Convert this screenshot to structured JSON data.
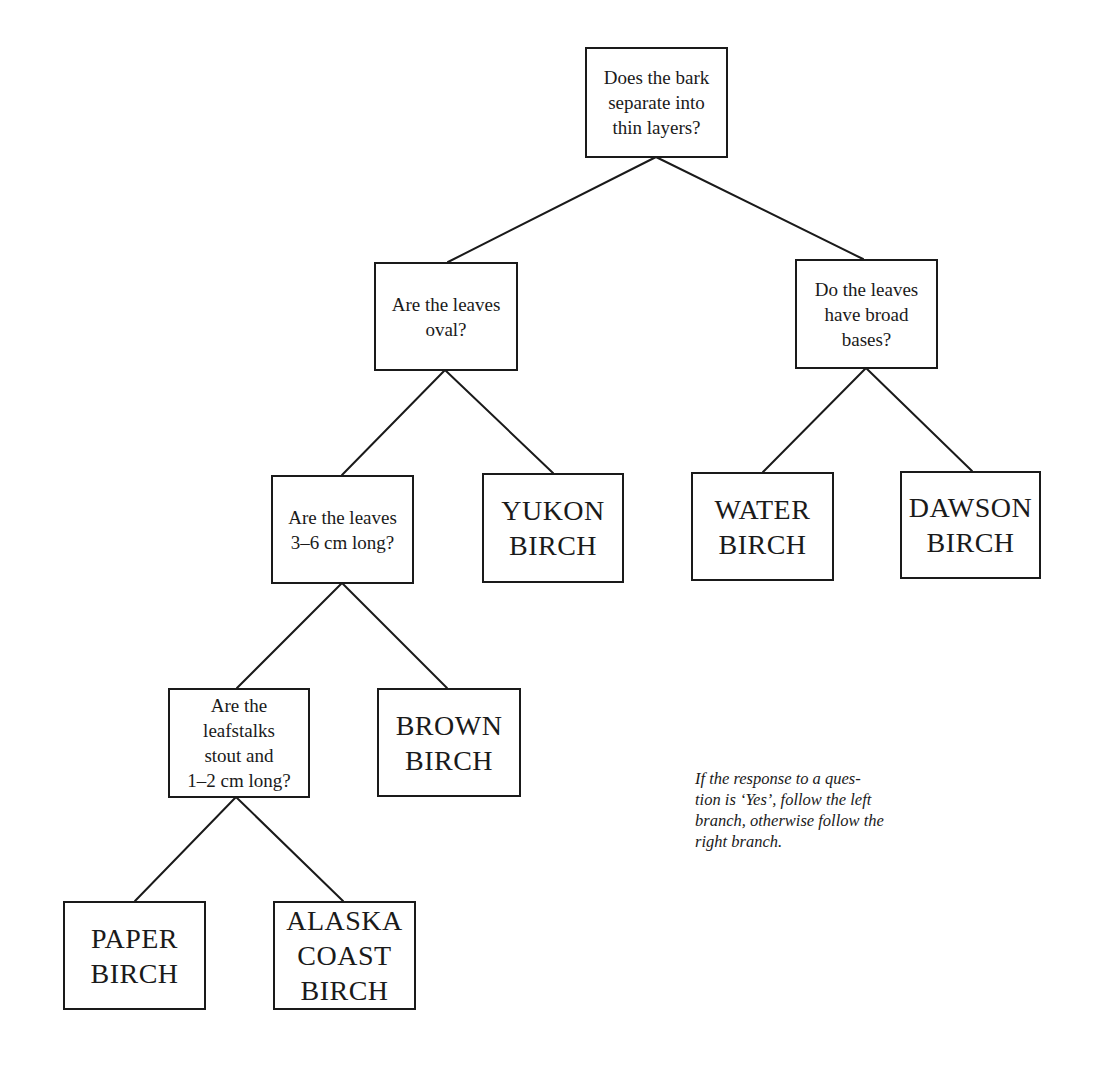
{
  "diagram": {
    "type": "decision-tree",
    "line_color": "#1a1a1a",
    "background": "#ffffff",
    "nodes": [
      {
        "id": "q-bark",
        "kind": "question",
        "text": "Does the bark\nseparate into\nthin layers?",
        "box": [
          585,
          47,
          143,
          111
        ]
      },
      {
        "id": "q-oval",
        "kind": "question",
        "text": "Are the leaves\noval?",
        "box": [
          374,
          262,
          144,
          109
        ]
      },
      {
        "id": "q-broad",
        "kind": "question",
        "text": "Do the leaves\nhave broad\nbases?",
        "box": [
          795,
          259,
          143,
          110
        ]
      },
      {
        "id": "q-length",
        "kind": "question",
        "text": "Are the leaves\n3–6 cm long?",
        "box": [
          271,
          475,
          143,
          109
        ]
      },
      {
        "id": "leaf-yukon",
        "kind": "answer",
        "text": "YUKON\nBIRCH",
        "box": [
          482,
          473,
          142,
          110
        ]
      },
      {
        "id": "leaf-water",
        "kind": "answer",
        "text": "WATER\nBIRCH",
        "box": [
          691,
          472,
          143,
          109
        ]
      },
      {
        "id": "leaf-dawson",
        "kind": "answer",
        "text": "DAWSON\nBIRCH",
        "box": [
          900,
          471,
          141,
          108
        ]
      },
      {
        "id": "q-leafstalks",
        "kind": "question",
        "text": "Are the\nleafstalks\nstout and\n1–2 cm long?",
        "box": [
          168,
          688,
          142,
          110
        ]
      },
      {
        "id": "leaf-brown",
        "kind": "answer",
        "text": "BROWN\nBIRCH",
        "box": [
          377,
          688,
          144,
          109
        ]
      },
      {
        "id": "leaf-paper",
        "kind": "answer",
        "text": "PAPER\nBIRCH",
        "box": [
          63,
          901,
          143,
          109
        ]
      },
      {
        "id": "leaf-alaska",
        "kind": "answer",
        "text": "ALASKA\nCOAST\nBIRCH",
        "box": [
          273,
          901,
          143,
          109
        ]
      }
    ],
    "edges": [
      {
        "from": "q-bark",
        "to": "q-oval",
        "branch": "yes",
        "x1": 656,
        "y1": 157,
        "x2": 448,
        "y2": 262
      },
      {
        "from": "q-bark",
        "to": "q-broad",
        "branch": "no",
        "x1": 656,
        "y1": 157,
        "x2": 863,
        "y2": 259
      },
      {
        "from": "q-oval",
        "to": "q-length",
        "branch": "yes",
        "x1": 445,
        "y1": 370,
        "x2": 342,
        "y2": 475
      },
      {
        "from": "q-oval",
        "to": "leaf-yukon",
        "branch": "no",
        "x1": 445,
        "y1": 370,
        "x2": 553,
        "y2": 473
      },
      {
        "from": "q-broad",
        "to": "leaf-water",
        "branch": "yes",
        "x1": 866,
        "y1": 368,
        "x2": 763,
        "y2": 472
      },
      {
        "from": "q-broad",
        "to": "leaf-dawson",
        "branch": "no",
        "x1": 866,
        "y1": 368,
        "x2": 972,
        "y2": 471
      },
      {
        "from": "q-length",
        "to": "q-leafstalks",
        "branch": "yes",
        "x1": 342,
        "y1": 583,
        "x2": 237,
        "y2": 688
      },
      {
        "from": "q-length",
        "to": "leaf-brown",
        "branch": "no",
        "x1": 342,
        "y1": 583,
        "x2": 447,
        "y2": 688
      },
      {
        "from": "q-leafstalks",
        "to": "leaf-paper",
        "branch": "yes",
        "x1": 236,
        "y1": 797,
        "x2": 135,
        "y2": 901
      },
      {
        "from": "q-leafstalks",
        "to": "leaf-alaska",
        "branch": "no",
        "x1": 236,
        "y1": 797,
        "x2": 343,
        "y2": 901
      }
    ],
    "note": "If the response to a ques-\ntion is ‘Yes’, follow the left\nbranch, otherwise follow the\nright branch."
  }
}
